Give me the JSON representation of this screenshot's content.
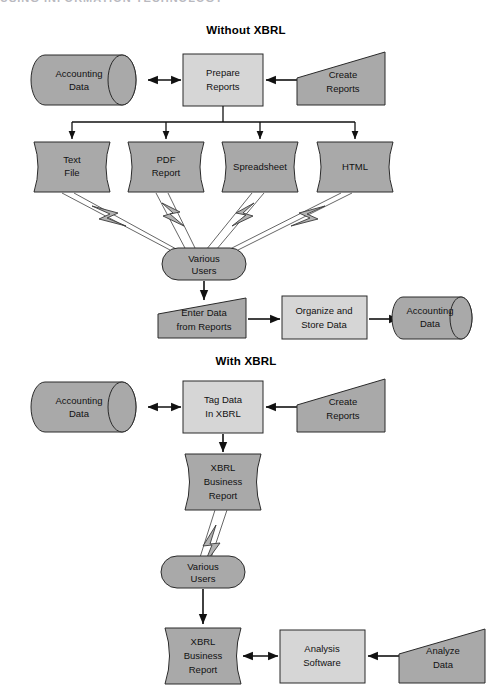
{
  "page": {
    "running_head": "USING INFORMATION TECHNOLOGY",
    "width": 493,
    "height": 692,
    "background": "#ffffff"
  },
  "colors": {
    "fill_dark": "#a9a9a9",
    "fill_light": "#d6d6d6",
    "bolt": "#b2b2b2",
    "outline": "#2a2a2a",
    "connector": "#111111",
    "text": "#111111"
  },
  "sections": [
    {
      "id": "without-xbrl",
      "title": "Without XBRL"
    },
    {
      "id": "with-xbrl",
      "title": "With XBRL"
    }
  ],
  "nodes": {
    "acct_data_top": {
      "label_line1": "Accounting",
      "label_line2": "Data",
      "shape": "cylinder",
      "fill": "dark"
    },
    "prepare_reports": {
      "label_line1": "Prepare",
      "label_line2": "Reports",
      "shape": "rectangle",
      "fill": "light"
    },
    "create_reports_top": {
      "label_line1": "Create",
      "label_line2": "Reports",
      "shape": "trapezoid-right-tall",
      "fill": "dark"
    },
    "text_file": {
      "label_line1": "Text",
      "label_line2": "File",
      "shape": "document",
      "fill": "dark"
    },
    "pdf_report": {
      "label_line1": "PDF",
      "label_line2": "Report",
      "shape": "document",
      "fill": "dark"
    },
    "spreadsheet": {
      "label_line1": "Spreadsheet",
      "label_line2": "",
      "shape": "document",
      "fill": "dark"
    },
    "html": {
      "label_line1": "HTML",
      "label_line2": "",
      "shape": "document",
      "fill": "dark"
    },
    "various_users_top": {
      "label_line1": "Various",
      "label_line2": "Users",
      "shape": "stadium",
      "fill": "dark"
    },
    "enter_data": {
      "label_line1": "Enter Data",
      "label_line2": "from Reports",
      "shape": "trapezoid-right-tall",
      "fill": "dark"
    },
    "organize_store": {
      "label_line1": "Organize and",
      "label_line2": "Store Data",
      "shape": "rectangle",
      "fill": "light"
    },
    "acct_data_right": {
      "label_line1": "Accounting",
      "label_line2": "Data",
      "shape": "cylinder",
      "fill": "dark"
    },
    "acct_data_bottom": {
      "label_line1": "Accounting",
      "label_line2": "Data",
      "shape": "cylinder",
      "fill": "dark"
    },
    "tag_data": {
      "label_line1": "Tag Data",
      "label_line2": "In XBRL",
      "shape": "rectangle",
      "fill": "light"
    },
    "create_reports_bot": {
      "label_line1": "Create",
      "label_line2": "Reports",
      "shape": "trapezoid-right-tall",
      "fill": "dark"
    },
    "xbrl_report_mid": {
      "label_line1": "XBRL",
      "label_line2": "Business",
      "label_line3": "Report",
      "shape": "document",
      "fill": "dark"
    },
    "various_users_bot": {
      "label_line1": "Various",
      "label_line2": "Users",
      "shape": "stadium",
      "fill": "dark"
    },
    "xbrl_report_bot": {
      "label_line1": "XBRL",
      "label_line2": "Business",
      "label_line3": "Report",
      "shape": "document",
      "fill": "dark"
    },
    "analysis_software": {
      "label_line1": "Analysis",
      "label_line2": "Software",
      "shape": "rectangle",
      "fill": "light"
    },
    "analyze_data": {
      "label_line1": "Analyze",
      "label_line2": "Data",
      "shape": "trapezoid-right-tall",
      "fill": "dark"
    }
  },
  "connectors": [
    {
      "from": "acct_data_top",
      "to": "prepare_reports",
      "style": "double-arrow"
    },
    {
      "from": "create_reports_top",
      "to": "prepare_reports",
      "style": "arrow"
    },
    {
      "from": "prepare_reports",
      "to": "text_file",
      "style": "arrow"
    },
    {
      "from": "prepare_reports",
      "to": "pdf_report",
      "style": "arrow"
    },
    {
      "from": "prepare_reports",
      "to": "spreadsheet",
      "style": "arrow"
    },
    {
      "from": "prepare_reports",
      "to": "html",
      "style": "arrow"
    },
    {
      "from": "text_file",
      "to": "various_users_top",
      "style": "lightning"
    },
    {
      "from": "pdf_report",
      "to": "various_users_top",
      "style": "lightning"
    },
    {
      "from": "spreadsheet",
      "to": "various_users_top",
      "style": "lightning"
    },
    {
      "from": "html",
      "to": "various_users_top",
      "style": "lightning"
    },
    {
      "from": "various_users_top",
      "to": "enter_data",
      "style": "arrow"
    },
    {
      "from": "enter_data",
      "to": "organize_store",
      "style": "arrow"
    },
    {
      "from": "organize_store",
      "to": "acct_data_right",
      "style": "arrow"
    },
    {
      "from": "acct_data_bottom",
      "to": "tag_data",
      "style": "double-arrow"
    },
    {
      "from": "create_reports_bot",
      "to": "tag_data",
      "style": "arrow"
    },
    {
      "from": "tag_data",
      "to": "xbrl_report_mid",
      "style": "arrow"
    },
    {
      "from": "xbrl_report_mid",
      "to": "various_users_bot",
      "style": "lightning"
    },
    {
      "from": "various_users_bot",
      "to": "xbrl_report_bot",
      "style": "arrow"
    },
    {
      "from": "xbrl_report_bot",
      "to": "analysis_software",
      "style": "double-arrow"
    },
    {
      "from": "analyze_data",
      "to": "analysis_software",
      "style": "arrow"
    }
  ]
}
